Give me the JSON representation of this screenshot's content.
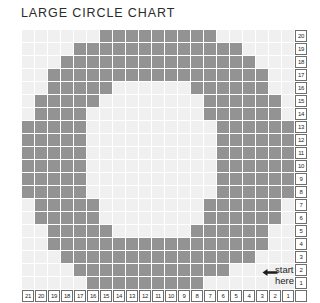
{
  "page": {
    "title": "LARGE CIRCLE CHART"
  },
  "annotation": {
    "line1": "start",
    "line2": "here",
    "arrow_icon": "left-arrow-icon"
  },
  "colors": {
    "filled_cell": "#939393",
    "empty_cell": "#f0f0f0",
    "label_border": "#6e6e6e",
    "text": "#1d1d1d",
    "title": "#2b2b2b",
    "background": "#ffffff"
  },
  "chart_data": {
    "type": "heatmap",
    "title": "LARGE CIRCLE CHART",
    "xlabel": "",
    "ylabel": "",
    "grid": true,
    "legend": "none",
    "columns": 21,
    "rows": 20,
    "column_labels": [
      21,
      20,
      19,
      18,
      17,
      16,
      15,
      14,
      13,
      12,
      11,
      10,
      9,
      8,
      7,
      6,
      5,
      4,
      3,
      2,
      1
    ],
    "row_labels": [
      20,
      19,
      18,
      17,
      16,
      15,
      14,
      13,
      12,
      11,
      10,
      9,
      8,
      7,
      6,
      5,
      4,
      3,
      2,
      1
    ],
    "value_meaning": {
      "0": "empty stitch",
      "1": "filled stitch"
    },
    "matrix": [
      [
        0,
        0,
        0,
        0,
        0,
        0,
        1,
        1,
        1,
        1,
        1,
        1,
        1,
        1,
        1,
        0,
        0,
        0,
        0,
        0,
        0
      ],
      [
        0,
        0,
        0,
        0,
        1,
        1,
        1,
        1,
        1,
        1,
        1,
        1,
        1,
        1,
        1,
        1,
        1,
        0,
        0,
        0,
        0
      ],
      [
        0,
        0,
        0,
        1,
        1,
        1,
        1,
        1,
        1,
        1,
        1,
        1,
        1,
        1,
        1,
        1,
        1,
        1,
        0,
        0,
        0
      ],
      [
        0,
        0,
        1,
        1,
        1,
        1,
        1,
        1,
        1,
        1,
        1,
        1,
        1,
        1,
        1,
        1,
        1,
        1,
        1,
        0,
        0
      ],
      [
        0,
        0,
        1,
        1,
        1,
        1,
        1,
        0,
        0,
        0,
        0,
        0,
        0,
        1,
        1,
        1,
        1,
        1,
        1,
        0,
        0
      ],
      [
        0,
        1,
        1,
        1,
        1,
        1,
        0,
        0,
        0,
        0,
        0,
        0,
        0,
        0,
        1,
        1,
        1,
        1,
        1,
        1,
        0
      ],
      [
        0,
        1,
        1,
        1,
        1,
        0,
        0,
        0,
        0,
        0,
        0,
        0,
        0,
        0,
        1,
        1,
        1,
        1,
        1,
        1,
        0
      ],
      [
        1,
        1,
        1,
        1,
        1,
        0,
        0,
        0,
        0,
        0,
        0,
        0,
        0,
        0,
        0,
        1,
        1,
        1,
        1,
        1,
        1
      ],
      [
        1,
        1,
        1,
        1,
        1,
        0,
        0,
        0,
        0,
        0,
        0,
        0,
        0,
        0,
        0,
        1,
        1,
        1,
        1,
        1,
        1
      ],
      [
        1,
        1,
        1,
        1,
        1,
        0,
        0,
        0,
        0,
        0,
        0,
        0,
        0,
        0,
        0,
        1,
        1,
        1,
        1,
        1,
        1
      ],
      [
        1,
        1,
        1,
        1,
        1,
        0,
        0,
        0,
        0,
        0,
        0,
        0,
        0,
        0,
        0,
        1,
        1,
        1,
        1,
        1,
        1
      ],
      [
        1,
        1,
        1,
        1,
        1,
        0,
        0,
        0,
        0,
        0,
        0,
        0,
        0,
        0,
        0,
        1,
        1,
        1,
        1,
        1,
        1
      ],
      [
        1,
        1,
        1,
        1,
        1,
        0,
        0,
        0,
        0,
        0,
        0,
        0,
        0,
        0,
        0,
        1,
        1,
        1,
        1,
        1,
        1
      ],
      [
        0,
        1,
        1,
        1,
        1,
        1,
        0,
        0,
        0,
        0,
        0,
        0,
        0,
        0,
        1,
        1,
        1,
        1,
        1,
        1,
        0
      ],
      [
        0,
        1,
        1,
        1,
        1,
        1,
        0,
        0,
        0,
        0,
        0,
        0,
        0,
        0,
        1,
        1,
        1,
        1,
        1,
        1,
        0
      ],
      [
        0,
        0,
        1,
        1,
        1,
        1,
        1,
        0,
        0,
        0,
        0,
        0,
        0,
        1,
        1,
        1,
        1,
        1,
        1,
        0,
        0
      ],
      [
        0,
        0,
        1,
        1,
        1,
        1,
        1,
        1,
        1,
        1,
        1,
        1,
        1,
        1,
        1,
        1,
        1,
        1,
        1,
        0,
        0
      ],
      [
        0,
        0,
        0,
        1,
        1,
        1,
        1,
        1,
        1,
        1,
        1,
        1,
        1,
        1,
        1,
        1,
        1,
        1,
        0,
        0,
        0
      ],
      [
        0,
        0,
        0,
        0,
        1,
        1,
        1,
        1,
        1,
        1,
        1,
        1,
        1,
        1,
        1,
        1,
        0,
        0,
        0,
        0,
        0
      ],
      [
        0,
        0,
        0,
        0,
        0,
        1,
        1,
        1,
        1,
        1,
        1,
        1,
        1,
        1,
        0,
        0,
        0,
        0,
        0,
        0,
        0
      ]
    ]
  }
}
